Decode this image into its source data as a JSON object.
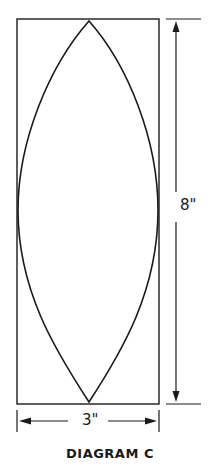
{
  "diagram": {
    "title": "DIAGRAM C",
    "shape": "pointed-oval (vesica) inscribed in rectangle",
    "height_label": "8\"",
    "width_label": "3\"",
    "colors": {
      "line": "#1a1a1a",
      "background": "#ffffff"
    }
  }
}
